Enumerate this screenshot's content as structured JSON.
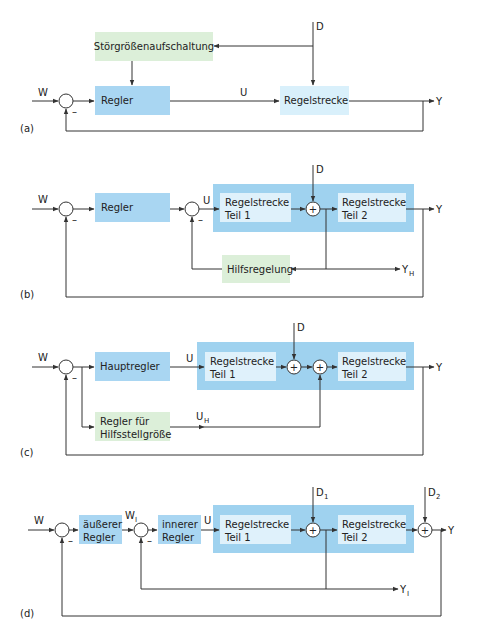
{
  "colors": {
    "controller_blue": "#a9d6f2",
    "plant_outer_blue": "#9fd2ef",
    "plant_inner_light": "#dff1fb",
    "plant_a_light": "#d9f0fb",
    "aux_green": "#dcefd9",
    "line": "#333333"
  },
  "panels": {
    "a": {
      "label": "(a)",
      "input": "W",
      "output": "Y",
      "disturbance": "D",
      "signal_u": "U",
      "feedforward_block": "Störgrößenaufschaltung",
      "controller_block": "Regler",
      "plant_block": "Regelstrecke",
      "minus": "–"
    },
    "b": {
      "label": "(b)",
      "input": "W",
      "output": "Y",
      "disturbance": "D",
      "signal_u": "U",
      "aux_output": "Y",
      "aux_output_sub": "H",
      "controller_block": "Regler",
      "plant1_line1": "Regelstrecke",
      "plant1_line2": "Teil 1",
      "plant2_line1": "Regelstrecke",
      "plant2_line2": "Teil 2",
      "aux_block": "Hilfsregelung",
      "plus": "+",
      "minus": "–"
    },
    "c": {
      "label": "(c)",
      "input": "W",
      "output": "Y",
      "disturbance": "D",
      "signal_u": "U",
      "aux_signal": "U",
      "aux_signal_sub": "H",
      "controller_block": "Hauptregler",
      "aux_block_line1": "Regler für",
      "aux_block_line2": "Hilfsstellgröße",
      "plant1_line1": "Regelstrecke",
      "plant1_line2": "Teil 1",
      "plant2_line1": "Regelstrecke",
      "plant2_line2": "Teil 2",
      "plus": "+",
      "minus": "–"
    },
    "d": {
      "label": "(d)",
      "input": "W",
      "output": "Y",
      "disturbance1": "D",
      "disturbance1_sub": "1",
      "disturbance2": "D",
      "disturbance2_sub": "2",
      "inner_setpoint": "W",
      "inner_setpoint_sub": "I",
      "signal_u": "U",
      "inner_output": "Y",
      "inner_output_sub": "I",
      "outer_controller_line1": "äußerer",
      "outer_controller_line2": "Regler",
      "inner_controller_line1": "innerer",
      "inner_controller_line2": "Regler",
      "plant1_line1": "Regelstrecke",
      "plant1_line2": "Teil 1",
      "plant2_line1": "Regelstrecke",
      "plant2_line2": "Teil 2",
      "plus": "+",
      "minus": "–"
    }
  }
}
